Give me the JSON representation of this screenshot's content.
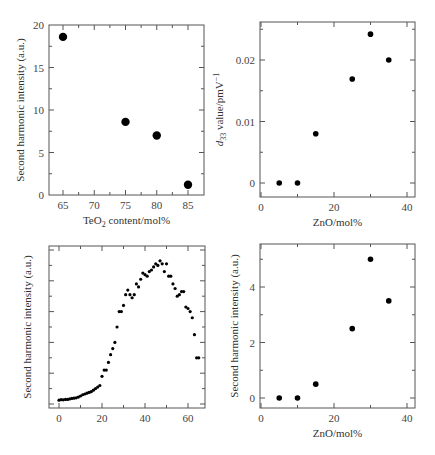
{
  "chart_data": [
    {
      "id": "top-left",
      "type": "scatter",
      "title": "",
      "xlabel": "TeO2 content/mol%",
      "xlabel_main": "TeO",
      "xlabel_sub": "2",
      "xlabel_rest": " content/mol%",
      "ylabel": "Second harmonic intensity (a.u.)",
      "xlim": [
        62.5,
        87.5
      ],
      "ylim": [
        0,
        20
      ],
      "xticks": [
        65,
        70,
        75,
        80,
        85
      ],
      "yticks": [
        0,
        5,
        10,
        15,
        20
      ],
      "x": [
        65,
        75,
        80,
        85
      ],
      "y": [
        18.6,
        8.6,
        7.0,
        1.2
      ],
      "marker_size": "large",
      "grid": false,
      "legend": null
    },
    {
      "id": "top-right",
      "type": "scatter",
      "title": "",
      "xlabel": "ZnO/mol%",
      "ylabel": "d33 value/pmV−1",
      "ylabel_main": "d",
      "ylabel_sub": "33",
      "ylabel_rest": " value/pmV",
      "ylabel_sup": "−1",
      "xlim": [
        0,
        42
      ],
      "ylim": [
        -0.002,
        0.026
      ],
      "xticks": [
        0,
        20,
        40
      ],
      "yticks": [
        0,
        0.01,
        0.02
      ],
      "ytick_labels": [
        "0",
        "0.01",
        "0.02"
      ],
      "x": [
        5,
        10,
        15,
        25,
        30,
        35
      ],
      "y": [
        0,
        0,
        0.008,
        0.0169,
        0.0242,
        0.02
      ],
      "marker_size": "small",
      "grid": false,
      "legend": null
    },
    {
      "id": "bottom-left",
      "type": "scatter",
      "title": "",
      "xlabel": "",
      "ylabel": "Second harmonic intensity (a.u.)",
      "xlim": [
        -4,
        68
      ],
      "ylim": [
        0,
        10
      ],
      "xticks": [
        0,
        20,
        40,
        60
      ],
      "yticks": [],
      "x": [
        0,
        1,
        2,
        3,
        4,
        5,
        6,
        7,
        8,
        9,
        10,
        11,
        12,
        13,
        14,
        15,
        16,
        17,
        18,
        19,
        20,
        21,
        22,
        23,
        24,
        25,
        26,
        27,
        28,
        29,
        30,
        31,
        32,
        33,
        34,
        35,
        36,
        37,
        38,
        39,
        40,
        41,
        42,
        43,
        44,
        45,
        46,
        47,
        48,
        49,
        50,
        51,
        52,
        53,
        54,
        55,
        56,
        57,
        58,
        59,
        60,
        61,
        62,
        63,
        64,
        65
      ],
      "y": [
        0.25,
        0.28,
        0.27,
        0.3,
        0.3,
        0.33,
        0.36,
        0.38,
        0.4,
        0.45,
        0.52,
        0.6,
        0.65,
        0.7,
        0.75,
        0.8,
        0.9,
        1.0,
        1.1,
        1.2,
        1.8,
        2.2,
        2.2,
        2.7,
        3.2,
        3.6,
        4.0,
        5.0,
        6.0,
        6.0,
        6.4,
        7.1,
        7.4,
        7.1,
        6.9,
        7.1,
        7.8,
        7.6,
        8.1,
        8.5,
        8.4,
        8.3,
        8.6,
        8.7,
        8.9,
        9.1,
        9.0,
        9.3,
        9.1,
        8.6,
        9.1,
        8.3,
        8.3,
        7.8,
        7.5,
        7.0,
        7.1,
        7.3,
        7.3,
        6.3,
        6.2,
        6.0,
        5.6,
        4.5,
        3.0,
        3.0
      ],
      "marker_size": "tiny",
      "grid": false,
      "legend": null
    },
    {
      "id": "bottom-right",
      "type": "scatter",
      "title": "",
      "xlabel": "ZnO/mol%",
      "ylabel": "Second harmonic intensity (a.u.)",
      "xlim": [
        0,
        42
      ],
      "ylim": [
        -0.3,
        5.6
      ],
      "xticks": [
        0,
        20,
        40
      ],
      "yticks": [
        0,
        2,
        4
      ],
      "x": [
        5,
        10,
        15,
        25,
        30,
        35
      ],
      "y": [
        0,
        0,
        0.5,
        2.5,
        5.0,
        3.5
      ],
      "marker_size": "small",
      "grid": false,
      "legend": null
    }
  ],
  "layout": {
    "panels": [
      {
        "frame": [
          49,
          25,
          204,
          195
        ]
      },
      {
        "frame": [
          260,
          22,
          415,
          197
        ]
      },
      {
        "frame": [
          49,
          246,
          205,
          408
        ]
      },
      {
        "frame": [
          260,
          244,
          415,
          408
        ]
      }
    ]
  }
}
